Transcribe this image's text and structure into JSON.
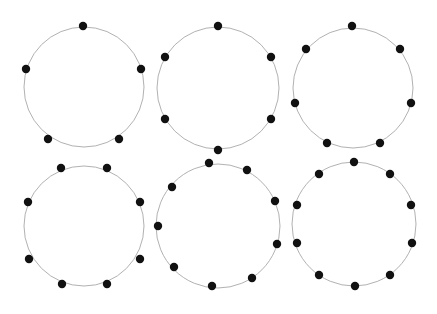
{
  "canvas": {
    "width": 437,
    "height": 314,
    "background": "#ffffff"
  },
  "style": {
    "circle_stroke": "#a8a8a8",
    "circle_stroke_width": 0.9,
    "dot_fill": "#111111",
    "dot_radius": 4.2
  },
  "figures": [
    {
      "label": "circle-5-points",
      "count": 5,
      "cx": 84,
      "cy": 87,
      "r": 60,
      "points": [
        [
          83,
          26
        ],
        [
          26,
          69
        ],
        [
          141,
          69
        ],
        [
          48,
          139
        ],
        [
          119,
          139
        ]
      ]
    },
    {
      "label": "circle-6-points",
      "count": 6,
      "cx": 218,
      "cy": 88,
      "r": 61,
      "points": [
        [
          218,
          26
        ],
        [
          165,
          57
        ],
        [
          271,
          57
        ],
        [
          165,
          119
        ],
        [
          271,
          119
        ],
        [
          218,
          150
        ]
      ]
    },
    {
      "label": "circle-7-points",
      "count": 7,
      "cx": 353,
      "cy": 88,
      "r": 60,
      "points": [
        [
          352,
          26
        ],
        [
          306,
          49
        ],
        [
          400,
          49
        ],
        [
          295,
          103
        ],
        [
          411,
          103
        ],
        [
          327,
          143
        ],
        [
          380,
          143
        ]
      ]
    },
    {
      "label": "circle-8-points",
      "count": 8,
      "cx": 84,
      "cy": 226,
      "r": 60,
      "points": [
        [
          61,
          168
        ],
        [
          107,
          168
        ],
        [
          28,
          202
        ],
        [
          140,
          202
        ],
        [
          29,
          259
        ],
        [
          140,
          259
        ],
        [
          62,
          284
        ],
        [
          107,
          284
        ]
      ]
    },
    {
      "label": "circle-9-points",
      "count": 9,
      "cx": 218,
      "cy": 226,
      "r": 62,
      "points": [
        [
          209,
          163
        ],
        [
          247,
          170
        ],
        [
          172,
          187
        ],
        [
          275,
          201
        ],
        [
          158,
          226
        ],
        [
          277,
          244
        ],
        [
          174,
          267
        ],
        [
          252,
          278
        ],
        [
          212,
          286
        ]
      ]
    },
    {
      "label": "circle-10-points",
      "count": 10,
      "cx": 354,
      "cy": 224,
      "r": 62,
      "points": [
        [
          354,
          162
        ],
        [
          319,
          174
        ],
        [
          390,
          174
        ],
        [
          297,
          205
        ],
        [
          411,
          205
        ],
        [
          297,
          243
        ],
        [
          412,
          243
        ],
        [
          319,
          275
        ],
        [
          390,
          275
        ],
        [
          355,
          286
        ]
      ]
    }
  ]
}
